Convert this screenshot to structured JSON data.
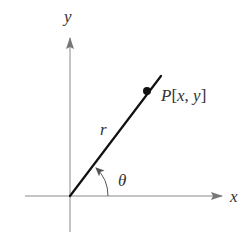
{
  "diagram": {
    "axes": {
      "x_label": "x",
      "y_label": "y"
    },
    "labels": {
      "point_letter": "P",
      "point_coords_open": "[",
      "point_x": "x",
      "point_comma": ", ",
      "point_y": "y",
      "point_coords_close": "]",
      "radius": "r",
      "angle": "θ"
    },
    "colors": {
      "axis": "#8a8a8a",
      "ray": "#111111",
      "point": "#111111",
      "text": "#333333",
      "arc": "#555555"
    }
  }
}
